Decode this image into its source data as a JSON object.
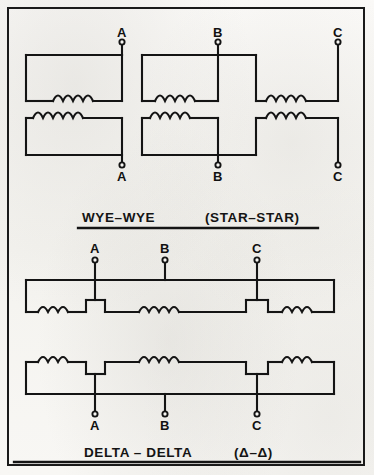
{
  "figure": {
    "title_hidden": "Three-phase transformer connection diagrams",
    "background_color": "#f7f6f3",
    "ink_color": "#111111",
    "border_color": "#1a1a1a"
  },
  "diagrams": [
    {
      "id": "wye-wye",
      "caption_left": "WYE–WYE",
      "caption_right": "(STAR–STAR)",
      "primary_terminals": [
        {
          "label": "A",
          "x": 122,
          "y": 44
        },
        {
          "label": "B",
          "x": 218,
          "y": 44
        },
        {
          "label": "C",
          "x": 338,
          "y": 44
        }
      ],
      "secondary_terminals": [
        {
          "label": "A",
          "x": 122,
          "y": 163
        },
        {
          "label": "B",
          "x": 218,
          "y": 163
        },
        {
          "label": "C",
          "x": 338,
          "y": 163
        }
      ]
    },
    {
      "id": "delta-delta",
      "caption_left": "DELTA – DELTA",
      "caption_right": "(Δ–Δ)",
      "primary_terminals": [
        {
          "label": "A",
          "x": 95,
          "y": 262
        },
        {
          "label": "B",
          "x": 165,
          "y": 262
        },
        {
          "label": "C",
          "x": 257,
          "y": 262
        }
      ],
      "secondary_terminals": [
        {
          "label": "A",
          "x": 95,
          "y": 412
        },
        {
          "label": "B",
          "x": 165,
          "y": 412
        },
        {
          "label": "C",
          "x": 257,
          "y": 412
        }
      ]
    }
  ],
  "labels": {
    "wye_primary_a": "A",
    "wye_primary_b": "B",
    "wye_primary_c": "C",
    "wye_secondary_a": "A",
    "wye_secondary_b": "B",
    "wye_secondary_c": "C",
    "delta_primary_a": "A",
    "delta_primary_b": "B",
    "delta_primary_c": "C",
    "delta_secondary_a": "A",
    "delta_secondary_b": "B",
    "delta_secondary_c": "C",
    "caption_wye_left": "WYE–WYE",
    "caption_wye_right": "(STAR–STAR)",
    "caption_delta_left": "DELTA – DELTA",
    "caption_delta_right": "(Δ–Δ)"
  }
}
